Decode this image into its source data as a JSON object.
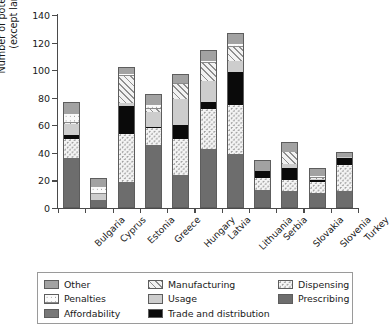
{
  "chart_data": {
    "type": "bar",
    "subtype": "stacked-bar",
    "title": "",
    "xlabel": "",
    "ylabel": "Number of potential barriers (except language)",
    "ylabel_lines": [
      "Number of potential barriers",
      "(except language)"
    ],
    "ylim": [
      0,
      140
    ],
    "yticks": [
      0,
      20,
      40,
      60,
      80,
      100,
      120,
      140
    ],
    "grid": false,
    "legend_position": "bottom",
    "categories": [
      "Bulgaria",
      "Cyprus",
      "Estonia",
      "Greece",
      "Hungary",
      "Latvia",
      "Lithuania",
      "Serbia",
      "Slovakia",
      "Slovenia",
      "Turkey"
    ],
    "series": [
      {
        "name": "Prescribing",
        "key": "prescribing",
        "fill": "solid-dark-grey",
        "values": [
          36,
          6,
          19,
          46,
          24,
          43,
          39,
          13,
          12,
          11,
          12
        ]
      },
      {
        "name": "Dispensing",
        "key": "dispensing",
        "fill": "dotted-white",
        "values": [
          14,
          0,
          35,
          12,
          26,
          29,
          36,
          9,
          8,
          8,
          19
        ]
      },
      {
        "name": "Trade and distribution",
        "key": "trade",
        "fill": "solid-black",
        "values": [
          3,
          0,
          20,
          1,
          10,
          5,
          24,
          5,
          9,
          1,
          5
        ]
      },
      {
        "name": "Usage",
        "key": "usage",
        "fill": "solid-light-grey",
        "values": [
          8,
          4,
          2,
          11,
          19,
          15,
          8,
          0,
          3,
          1,
          1
        ]
      },
      {
        "name": "Manufacturing",
        "key": "manufacturing",
        "fill": "diagonal-hatch",
        "values": [
          1,
          0,
          20,
          2,
          11,
          13,
          10,
          0,
          9,
          1,
          0
        ]
      },
      {
        "name": "Penalties",
        "key": "penalties",
        "fill": "dashed-dotted",
        "values": [
          6,
          5,
          1,
          3,
          1,
          2,
          2,
          0,
          0,
          1,
          0
        ]
      },
      {
        "name": "Other",
        "key": "other",
        "fill": "solid-mid-grey",
        "values": [
          9,
          7,
          5,
          8,
          6,
          8,
          8,
          8,
          7,
          6,
          4
        ]
      }
    ],
    "totals": [
      77,
      22,
      102,
      83,
      97,
      115,
      127,
      35,
      48,
      29,
      41
    ]
  },
  "axis": {
    "y_tick_labels": [
      "140",
      "120",
      "100",
      "80",
      "60",
      "40",
      "20",
      "0"
    ],
    "y_title_line1": "Number of potential barriers",
    "y_title_line2": "(except language)"
  },
  "legend": {
    "rows": [
      [
        {
          "label": "Other",
          "key": "other"
        },
        {
          "label": "Manufacturing",
          "key": "manufacturing"
        },
        {
          "label": "Dispensing",
          "key": "dispensing"
        }
      ],
      [
        {
          "label": "Penalties",
          "key": "penalties"
        },
        {
          "label": "Usage",
          "key": "usage"
        },
        {
          "label": "Prescribing",
          "key": "prescribing"
        }
      ],
      [
        {
          "label": "Affordability",
          "key": "affordability"
        },
        {
          "label": "Trade and distribution",
          "key": "trade"
        },
        {
          "label": "",
          "key": ""
        }
      ]
    ]
  },
  "colors": {
    "prescribing": "#6d6d6d",
    "trade": "#0a0a0a",
    "usage": "#cdcdcd",
    "other": "#a2a2a2",
    "affordability": "#787878",
    "axis": "#4a4a4a",
    "text": "#1a1a1a"
  }
}
